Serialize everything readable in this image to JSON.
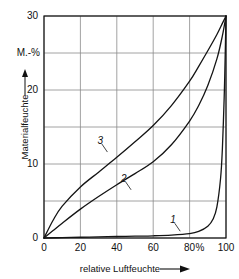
{
  "chart_data": {
    "type": "line",
    "title": "",
    "xlabel": "relative Luftfeuchte",
    "ylabel": "Materialfeuchte",
    "yunit": "M.-%",
    "xunit": "%",
    "xlim": [
      0,
      100
    ],
    "ylim": [
      0,
      30
    ],
    "xticks": [
      "0",
      "20",
      "40",
      "60",
      "80",
      "100"
    ],
    "xtick_values": [
      0,
      20,
      40,
      60,
      80,
      100
    ],
    "yticks": [
      "0",
      "10",
      "20",
      "30"
    ],
    "ytick_values": [
      0,
      10,
      20,
      30
    ],
    "grid": true,
    "grid_x_values": [
      0,
      20,
      40,
      60,
      80,
      100
    ],
    "grid_y_values": [
      0,
      5,
      10,
      15,
      20,
      25,
      30
    ],
    "legend": "inline-labels",
    "series": [
      {
        "name": "1",
        "label": "1",
        "x": [
          0,
          10,
          20,
          30,
          40,
          50,
          60,
          70,
          80,
          85,
          90,
          93,
          95,
          97,
          98,
          99,
          99.5,
          100
        ],
        "values": [
          0,
          0.05,
          0.1,
          0.15,
          0.2,
          0.25,
          0.3,
          0.4,
          0.6,
          0.9,
          1.6,
          2.6,
          4.2,
          8.0,
          12.0,
          19.0,
          24.0,
          30
        ]
      },
      {
        "name": "2",
        "label": "2",
        "x": [
          0,
          5,
          10,
          20,
          30,
          40,
          50,
          60,
          70,
          80,
          85,
          90,
          95,
          98,
          100
        ],
        "values": [
          0,
          1.0,
          2.0,
          3.9,
          5.6,
          7.2,
          8.7,
          10.3,
          12.6,
          15.8,
          17.9,
          20.6,
          24.2,
          27.3,
          30
        ]
      },
      {
        "name": "3",
        "label": "3",
        "x": [
          0,
          5,
          10,
          20,
          30,
          40,
          50,
          60,
          70,
          80,
          85,
          90,
          95,
          98,
          100
        ],
        "values": [
          0,
          2.4,
          4.3,
          6.9,
          8.9,
          10.9,
          13.0,
          15.2,
          17.9,
          21.2,
          23.2,
          25.3,
          27.5,
          29.0,
          30
        ]
      }
    ],
    "annotations": [
      {
        "text": "1",
        "x": 71,
        "y": 2.4
      },
      {
        "text": "2",
        "x": 44,
        "y": 8.0
      },
      {
        "text": "3",
        "x": 31,
        "y": 13.1
      }
    ],
    "colors": {
      "curve": "#141414",
      "grid": "#8a8a8a",
      "axis": "#141414",
      "background": "#ffffff",
      "text": "#111111"
    }
  }
}
